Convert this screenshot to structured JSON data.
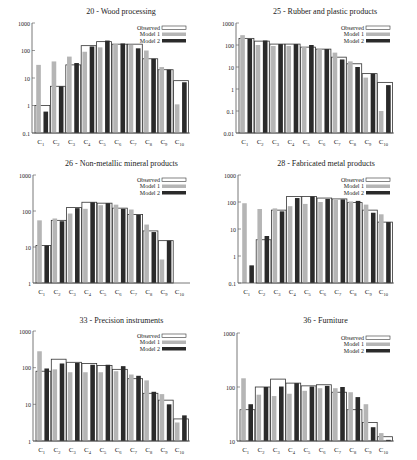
{
  "colors": {
    "observed": "#ffffff",
    "model1": "#b5b5b5",
    "model2": "#2a2a2a",
    "axis": "#555555"
  },
  "legend": [
    "Observed",
    "Model 1",
    "Model 2"
  ],
  "categories": [
    "C1",
    "C2",
    "C3",
    "C4",
    "C5",
    "C6",
    "C7",
    "C8",
    "C9",
    "C10"
  ],
  "chart_data": [
    {
      "type": "bar",
      "title": "20 - Wood processing",
      "yscale": "log",
      "ylim": [
        0.1,
        1000
      ],
      "yticks": [
        "0.1",
        "1",
        "10",
        "100",
        "1000"
      ],
      "categories": [
        "C1",
        "C2",
        "C3",
        "C4",
        "C5",
        "C6",
        "C7",
        "C8",
        "C9",
        "C10"
      ],
      "series": [
        {
          "name": "Observed",
          "values": [
            1,
            5,
            30,
            150,
            210,
            170,
            170,
            50,
            20,
            8
          ]
        },
        {
          "name": "Model 1",
          "values": [
            30,
            40,
            60,
            90,
            130,
            170,
            160,
            100,
            25,
            1.1
          ]
        },
        {
          "name": "Model 2",
          "values": [
            0.6,
            5,
            35,
            140,
            230,
            180,
            120,
            50,
            20,
            7
          ]
        }
      ]
    },
    {
      "type": "bar",
      "title": "25 - Rubber and plastic products",
      "yscale": "log",
      "ylim": [
        0.01,
        1000
      ],
      "yticks": [
        "0.01",
        "0.1",
        "1",
        "10",
        "100",
        "1000"
      ],
      "categories": [
        "C1",
        "C2",
        "C3",
        "C4",
        "C5",
        "C6",
        "C7",
        "C8",
        "C9",
        "C10"
      ],
      "series": [
        {
          "name": "Observed",
          "values": [
            200,
            150,
            110,
            110,
            80,
            65,
            28,
            14,
            5,
            2
          ]
        },
        {
          "name": "Model 1",
          "values": [
            280,
            100,
            90,
            90,
            80,
            65,
            45,
            18,
            3.3,
            0.1
          ]
        },
        {
          "name": "Model 2",
          "values": [
            190,
            160,
            110,
            110,
            100,
            65,
            22,
            10,
            5,
            1.5
          ]
        }
      ]
    },
    {
      "type": "bar",
      "title": "26 - Non-metallic mineral products",
      "yscale": "log",
      "ylim": [
        1,
        1000
      ],
      "yticks": [
        "1",
        "10",
        "100",
        "1000"
      ],
      "categories": [
        "C1",
        "C2",
        "C3",
        "C4",
        "C5",
        "C6",
        "C7",
        "C8",
        "C9",
        "C10"
      ],
      "series": [
        {
          "name": "Observed",
          "values": [
            11,
            55,
            125,
            175,
            165,
            120,
            80,
            28,
            15,
            1
          ]
        },
        {
          "name": "Model 1",
          "values": [
            55,
            62,
            85,
            115,
            145,
            150,
            110,
            42,
            4.5,
            1
          ]
        },
        {
          "name": "Model 2",
          "values": [
            11,
            52,
            120,
            175,
            165,
            115,
            78,
            26,
            15,
            1
          ]
        }
      ]
    },
    {
      "type": "bar",
      "title": "28 - Fabricated metal products",
      "yscale": "log",
      "ylim": [
        0.1,
        1000
      ],
      "yticks": [
        "0.1",
        "1",
        "10",
        "100",
        "1000"
      ],
      "categories": [
        "C1",
        "C2",
        "C3",
        "C4",
        "C5",
        "C6",
        "C7",
        "C8",
        "C9",
        "C10"
      ],
      "series": [
        {
          "name": "Observed",
          "values": [
            0.1,
            4,
            50,
            160,
            160,
            140,
            130,
            95,
            50,
            18
          ]
        },
        {
          "name": "Model 1",
          "values": [
            90,
            55,
            58,
            70,
            85,
            100,
            120,
            105,
            80,
            35
          ]
        },
        {
          "name": "Model 2",
          "values": [
            0.45,
            5.5,
            45,
            140,
            160,
            130,
            125,
            110,
            40,
            18
          ]
        }
      ]
    },
    {
      "type": "bar",
      "title": "33 - Precision instruments",
      "yscale": "log",
      "ylim": [
        1,
        1000
      ],
      "yticks": [
        "1",
        "10",
        "100",
        "1000"
      ],
      "categories": [
        "C1",
        "C2",
        "C3",
        "C4",
        "C5",
        "C6",
        "C7",
        "C8",
        "C9",
        "C10"
      ],
      "series": [
        {
          "name": "Observed",
          "values": [
            80,
            170,
            140,
            130,
            115,
            90,
            50,
            20,
            13,
            4
          ]
        },
        {
          "name": "Model 1",
          "values": [
            280,
            90,
            75,
            75,
            75,
            80,
            65,
            45,
            19,
            3.2
          ]
        },
        {
          "name": "Model 2",
          "values": [
            95,
            130,
            135,
            120,
            120,
            110,
            60,
            22,
            10,
            5
          ]
        }
      ]
    },
    {
      "type": "bar",
      "title": "36 - Furniture",
      "yscale": "log",
      "ylim": [
        10,
        1000
      ],
      "yticks": [
        "10",
        "100",
        "1000"
      ],
      "categories": [
        "C1",
        "C2",
        "C3",
        "C4",
        "C5",
        "C6",
        "C7",
        "C8",
        "C9",
        "C10"
      ],
      "series": [
        {
          "name": "Observed",
          "values": [
            38,
            100,
            140,
            118,
            105,
            110,
            80,
            38,
            22,
            12
          ]
        },
        {
          "name": "Model 1",
          "values": [
            145,
            72,
            68,
            75,
            85,
            95,
            95,
            80,
            48,
            14
          ]
        },
        {
          "name": "Model 2",
          "values": [
            48,
            100,
            102,
            118,
            102,
            105,
            100,
            65,
            18,
            10.5
          ]
        }
      ]
    }
  ]
}
